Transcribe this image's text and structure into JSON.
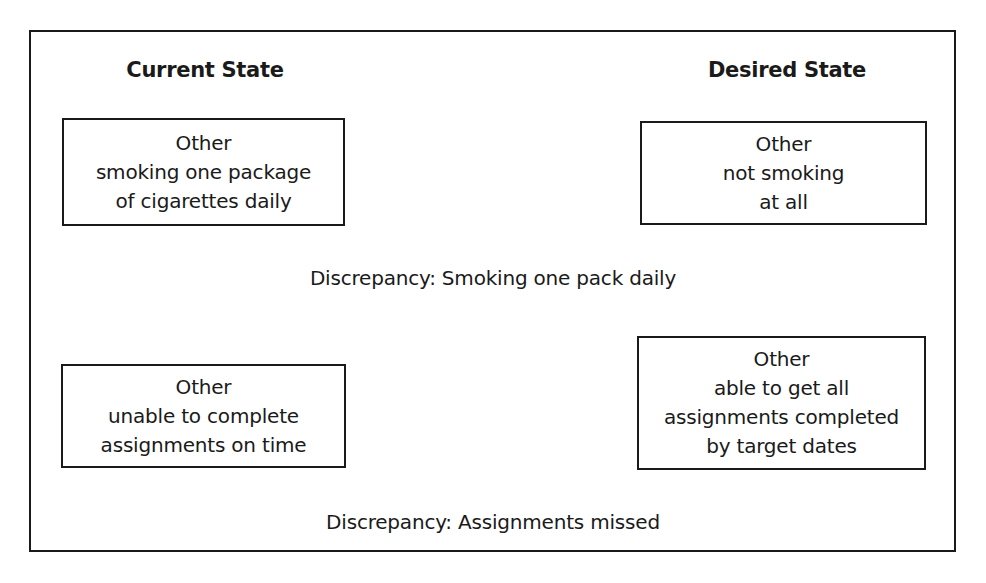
{
  "diagram": {
    "headings": {
      "current": "Current State",
      "desired": "Desired State"
    },
    "rows": [
      {
        "current": {
          "lines": [
            "Other",
            "smoking one package",
            "of cigarettes daily"
          ]
        },
        "desired": {
          "lines": [
            "Other",
            "not smoking",
            "at all"
          ]
        },
        "discrepancy": "Discrepancy: Smoking one pack daily"
      },
      {
        "current": {
          "lines": [
            "Other",
            "unable to complete",
            "assignments on time"
          ]
        },
        "desired": {
          "lines": [
            "Other",
            "able to get all",
            "assignments completed",
            "by target dates"
          ]
        },
        "discrepancy": "Discrepancy: Assignments missed"
      }
    ],
    "colors": {
      "ink": "#1a1a1a",
      "background": "#ffffff"
    }
  }
}
